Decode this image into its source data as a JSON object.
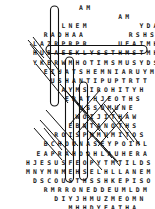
{
  "puzzle": {
    "type": "word-search",
    "shape": "angel",
    "ink_color": "#1a1a1a",
    "mark_color": "#111111",
    "background": "#ffffff",
    "rows": [
      {
        "indent": 13,
        "letters": "AM"
      },
      {
        "indent": 13,
        "letters": "AM"
      },
      {
        "indent": 10,
        "letters": "LNEM"
      },
      {
        "indent": 8,
        "letters": "RADHAA"
      },
      {
        "indent": 7,
        "letters": "LAZRPRPR"
      },
      {
        "indent": 5,
        "letters": "HUBAEEKLYSSTHMSTMH"
      },
      {
        "indent": 5,
        "letters": "YKBRWMHOTIMSMUSYDS"
      },
      {
        "indent": 6,
        "letters": "EIUATSHEMNIARUYM"
      },
      {
        "indent": 6,
        "letters": "USHANTIPUPTRTT"
      },
      {
        "indent": 7,
        "letters": "AYMSIROHITYH"
      },
      {
        "indent": 7,
        "letters": "ERATHJEOTHS"
      },
      {
        "indent": 8,
        "letters": "USSOMUNE"
      },
      {
        "indent": 8,
        "letters": "WOIJITHAW"
      },
      {
        "indent": 7,
        "letters": "EBNTANOTHS"
      },
      {
        "indent": 6,
        "letters": "ROISPHMUMITOS"
      },
      {
        "indent": 5,
        "letters": "BCHOUNASEYPOIML"
      },
      {
        "indent": 4,
        "letters": "EAPRAHODHLAUHERA"
      },
      {
        "indent": 3,
        "letters": "HJESUSFEOPYTMTILDS"
      },
      {
        "indent": 3,
        "letters": "MNYMNMEHSELHLLANEM"
      },
      {
        "indent": 4,
        "letters": "DSCOUSTHSSHKEPISO"
      },
      {
        "indent": 5,
        "letters": "RMRRONEDDEUMLDM"
      },
      {
        "indent": 6,
        "letters": "DIYJHMUZMEOMN"
      },
      {
        "indent": 7,
        "letters": "MHHDYEATHA"
      },
      {
        "indent": 8,
        "letters": "ITUJOSEPHY"
      },
      {
        "indent": 9,
        "letters": "ANTHONY"
      },
      {
        "indent": 11,
        "letters": "TERRY"
      },
      {
        "indent": 12,
        "letters": "JIM"
      }
    ],
    "right_rows": [
      {
        "row": 0,
        "offset": 24,
        "letters": "HM"
      },
      {
        "row": 2,
        "offset": 21,
        "letters": "YDAU"
      },
      {
        "row": 3,
        "offset": 20,
        "letters": "RSHSAB"
      },
      {
        "row": 4,
        "offset": 19,
        "letters": "UEAIMHIY"
      }
    ],
    "found_words": [
      "MEN",
      "AMEN",
      "JESUS",
      "JOSEPH",
      "ANTHONY",
      "TERRY",
      "JIM",
      "OPTIMUS",
      "HOPE",
      "FAITH",
      "MOTHER"
    ],
    "marks": {
      "ovals": [
        {
          "name": "oval-vertical-1",
          "x": 50.5,
          "y": 6,
          "w": 8,
          "h": 100,
          "rx": 4
        },
        {
          "name": "oval-vertical-2",
          "x": 65.5,
          "y": 57,
          "w": 8,
          "h": 125,
          "rx": 4
        },
        {
          "name": "oval-vertical-3",
          "x": 79.5,
          "y": 82,
          "w": 8,
          "h": 98,
          "rx": 4
        },
        {
          "name": "oval-horizontal-long",
          "x": 46,
          "y": 45.5,
          "w": 101,
          "h": 8,
          "rx": 4
        }
      ],
      "slashes": [
        {
          "name": "slash-1",
          "x1": 33,
          "y1": 37,
          "x2": 60,
          "y2": 72
        },
        {
          "name": "slash-2",
          "x1": 30,
          "y1": 44,
          "x2": 55,
          "y2": 76
        },
        {
          "name": "slash-3",
          "x1": 36,
          "y1": 64,
          "x2": 68,
          "y2": 103
        },
        {
          "name": "slash-4",
          "x1": 60,
          "y1": 84,
          "x2": 96,
          "y2": 124
        },
        {
          "name": "slash-5",
          "x1": 66,
          "y1": 91,
          "x2": 100,
          "y2": 131
        },
        {
          "name": "slash-6",
          "x1": 72,
          "y1": 96,
          "x2": 108,
          "y2": 138
        },
        {
          "name": "slash-7",
          "x1": 46,
          "y1": 110,
          "x2": 78,
          "y2": 146
        },
        {
          "name": "slash-8",
          "x1": 40,
          "y1": 120,
          "x2": 72,
          "y2": 155
        },
        {
          "name": "slash-9",
          "x1": 34,
          "y1": 128,
          "x2": 62,
          "y2": 160
        },
        {
          "name": "slash-10",
          "x1": 96,
          "y1": 100,
          "x2": 128,
          "y2": 140
        },
        {
          "name": "slash-11",
          "x1": 104,
          "y1": 104,
          "x2": 134,
          "y2": 142
        },
        {
          "name": "slash-12",
          "x1": 112,
          "y1": 108,
          "x2": 140,
          "y2": 145
        },
        {
          "name": "slash-13",
          "x1": 84,
          "y1": 126,
          "x2": 112,
          "y2": 158
        },
        {
          "name": "slash-14",
          "x1": 90,
          "y1": 132,
          "x2": 118,
          "y2": 162
        },
        {
          "name": "slash-15",
          "x1": 96,
          "y1": 138,
          "x2": 120,
          "y2": 166
        },
        {
          "name": "slash-16",
          "x1": 100,
          "y1": 90,
          "x2": 70,
          "y2": 124
        },
        {
          "name": "slash-17",
          "x1": 110,
          "y1": 96,
          "x2": 78,
          "y2": 132
        },
        {
          "name": "slash-18",
          "x1": 120,
          "y1": 104,
          "x2": 88,
          "y2": 140
        },
        {
          "name": "slash-19",
          "x1": 128,
          "y1": 112,
          "x2": 98,
          "y2": 146
        },
        {
          "name": "slash-20",
          "x1": 86,
          "y1": 152,
          "x2": 102,
          "y2": 170
        },
        {
          "name": "slash-21",
          "x1": 44,
          "y1": 128,
          "x2": 62,
          "y2": 150
        },
        {
          "name": "slash-22",
          "x1": 28,
          "y1": 40,
          "x2": 44,
          "y2": 58
        }
      ]
    }
  }
}
